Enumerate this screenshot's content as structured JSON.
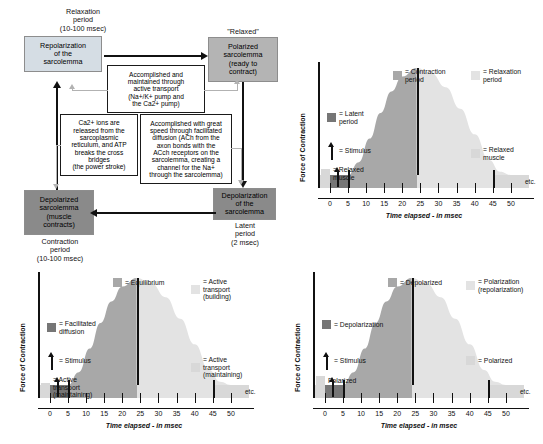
{
  "colors": {
    "light_gray": "#d8d8d8",
    "mid_gray": "#a8a8a8",
    "dark_gray": "#767676",
    "pale_gray": "#e3e3e3",
    "box_light": "#d5dde4",
    "box_mid": "#b4b4b4",
    "box_dark": "#8a8a8a",
    "line": "#111111",
    "gray_line": "#b2b2b2"
  },
  "diagram": {
    "boxes": {
      "repolarization": "Repolarization\nof the\nsarcolemma",
      "polarized": "Polarized\nsarcolemma\n(ready to\ncontract)",
      "depolarized": "Depolarized\nsarcolemma\n(muscle\ncontracts)",
      "depolarization": "Depolarization\nof the\nsarcolemma",
      "active_transport": "Accomplished and\nmaintained through\nactive transport\n(Na+/K+ pump and\nthe Ca2+ pump)",
      "calcium": "Ca2+ ions are\nreleased from the\nsarcoplasmic\nreticulum, and ATP\nbreaks the cross\nbridges\n(the power stroke)",
      "facilitated": "Accomplished with great\nspeed through facilitated\ndiffusion (ACh from the\naxon bonds with the\nACch receptors on the\nsarcolemma, creating a\nchannel for the Na+\nthrough the sarcolemma)"
    },
    "captions": {
      "relaxation_period": "Relaxation\nperiod\n(10-100 msec)",
      "relaxed": "\"Relaxed\"",
      "contraction_period": "Contraction\nperiod\n(10-100 msec)",
      "latent_period": "Latent\nperiod\n(2 msec)"
    }
  },
  "charts": [
    {
      "id": "chart-top-right",
      "ylabel": "Force of Contraction",
      "xlabel": "Time elapsed - in msec",
      "etc": "etc.",
      "legend": [
        {
          "name": "latent-period",
          "swatch": "#767676",
          "text": "= Latent\nperiod"
        },
        {
          "name": "stimulus",
          "swatch": "arrow",
          "text": "= Stimulus"
        },
        {
          "name": "relaxed-muscle-left",
          "swatch": "#d8d8d8",
          "text": "= Relaxed\nmuscle"
        },
        {
          "name": "contraction-period",
          "swatch": "#a8a8a8",
          "text": "= Contraction\nperiod"
        },
        {
          "name": "relaxation-period",
          "swatch": "#e3e3e3",
          "text": "= Relaxation\nperiod"
        },
        {
          "name": "relaxed-muscle-right",
          "swatch": "#d8d8d8",
          "text": "= Relaxed\nmuscle"
        }
      ]
    },
    {
      "id": "chart-bottom-left",
      "ylabel": "Force of Contraction",
      "xlabel": "Time elapsed - in msec",
      "etc": "etc.",
      "legend": [
        {
          "name": "facilitated-diffusion",
          "swatch": "#767676",
          "text": "= Facilitated\ndiffusion"
        },
        {
          "name": "stimulus",
          "swatch": "arrow",
          "text": "= Stimulus"
        },
        {
          "name": "active-transport-maintaining-left",
          "swatch": "#d8d8d8",
          "text": "= Active\ntransport\n(maintaining)"
        },
        {
          "name": "equilibrium",
          "swatch": "#a8a8a8",
          "text": "= Equilibrium"
        },
        {
          "name": "active-transport-building",
          "swatch": "#e3e3e3",
          "text": "= Active\ntransport\n(building)"
        },
        {
          "name": "active-transport-maintaining-right",
          "swatch": "#d8d8d8",
          "text": "= Active\ntransport\n(maintaining)"
        }
      ]
    },
    {
      "id": "chart-bottom-right",
      "ylabel": "Force of Contraction",
      "xlabel": "Time elapsed - in msec",
      "etc": "etc.",
      "legend": [
        {
          "name": "depolarization",
          "swatch": "#767676",
          "text": "= Depolarization"
        },
        {
          "name": "stimulus",
          "swatch": "arrow",
          "text": "= Stimulus"
        },
        {
          "name": "polarized-left",
          "swatch": "#d8d8d8",
          "text": "Polarized"
        },
        {
          "name": "depolarized",
          "swatch": "#a8a8a8",
          "text": "= Depolarized"
        },
        {
          "name": "polarization",
          "swatch": "#e3e3e3",
          "text": "= Polarization\n(repolarization)"
        },
        {
          "name": "polarized-right",
          "swatch": "#d8d8d8",
          "text": "= Polarized"
        }
      ]
    }
  ],
  "chart_data": {
    "type": "area",
    "title": "",
    "xlabel": "Time elapsed - in msec",
    "ylabel": "Force of Contraction",
    "xlim": [
      -3,
      55
    ],
    "ylim": [
      0,
      1
    ],
    "xticks": [
      0,
      5,
      10,
      15,
      20,
      25,
      30,
      35,
      40,
      45,
      50
    ],
    "grid": false,
    "annotations": [
      "etc."
    ],
    "phases": [
      {
        "name": "relaxed muscle (baseline)",
        "x_start": -3,
        "x_end": 0
      },
      {
        "name": "latent period",
        "x_start": 0,
        "x_end": 5
      },
      {
        "name": "contraction period",
        "x_start": 5,
        "x_end": 24
      },
      {
        "name": "relaxation period",
        "x_start": 24,
        "x_end": 45
      },
      {
        "name": "relaxed muscle (baseline)",
        "x_start": 45,
        "x_end": 55
      }
    ],
    "stimulus_x": 2,
    "peak_x": 24,
    "x": [
      0,
      5,
      8,
      11,
      14,
      17,
      20,
      24,
      28,
      32,
      36,
      40,
      44,
      47,
      50
    ],
    "y": [
      0,
      0,
      0.12,
      0.34,
      0.58,
      0.78,
      0.92,
      1.0,
      0.95,
      0.82,
      0.62,
      0.38,
      0.14,
      0.03,
      0
    ]
  }
}
